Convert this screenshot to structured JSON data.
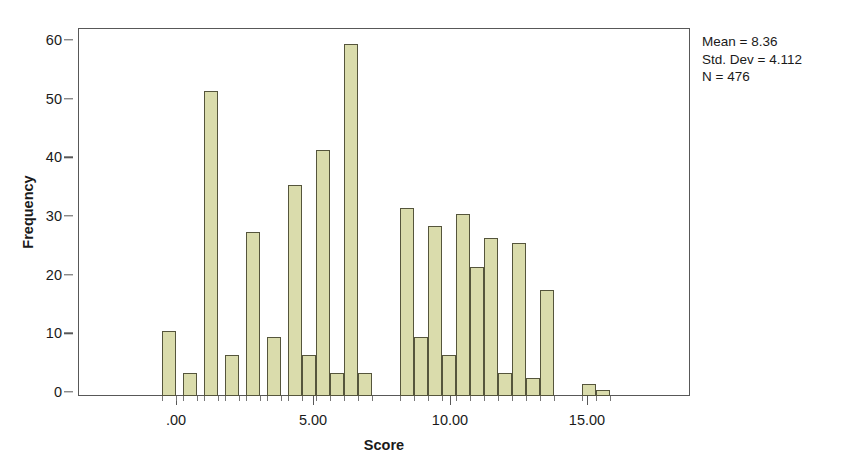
{
  "chart_data": {
    "type": "bar",
    "title": "",
    "subtitle": "",
    "xlabel": "Score",
    "ylabel": "Frequency",
    "xlim": [
      -1.0,
      17.2
    ],
    "ylim": [
      0,
      63
    ],
    "grid": false,
    "legend": null,
    "bar_width_units": 0.42,
    "x_ticks": [
      {
        "value": 0,
        "label": ".00"
      },
      {
        "value": 5,
        "label": "5.00"
      },
      {
        "value": 10,
        "label": "10.00"
      },
      {
        "value": 15,
        "label": "15.00"
      }
    ],
    "y_ticks": [
      {
        "value": 0,
        "label": "0"
      },
      {
        "value": 10,
        "label": "10"
      },
      {
        "value": 20,
        "label": "20"
      },
      {
        "value": 30,
        "label": "30"
      },
      {
        "value": 40,
        "label": "40"
      },
      {
        "value": 50,
        "label": "50"
      },
      {
        "value": 60,
        "label": "60"
      }
    ],
    "x": [
      -0.5,
      0.0,
      1.0,
      1.5,
      2.5,
      3.0,
      4.0,
      4.5,
      5.0,
      5.5,
      6.5,
      7.0,
      8.0,
      8.5,
      9.5,
      10.0,
      10.5,
      11.0,
      11.5,
      12.0,
      12.5,
      13.0,
      13.5,
      14.0,
      15.0,
      15.5,
      16.0
    ],
    "categories": [
      "-0.5",
      "0.0",
      "1.0",
      "1.5",
      "2.5",
      "3.0",
      "4.0",
      "4.5",
      "5.0",
      "5.5",
      "6.5",
      "7.0",
      "8.0",
      "8.5",
      "9.5",
      "10.0",
      "10.5",
      "11.0",
      "11.5",
      "12.0",
      "12.5",
      "13.0",
      "13.5",
      "14.0",
      "15.0",
      "15.5",
      "16.0"
    ],
    "values": [
      11,
      4,
      52,
      7,
      28,
      10,
      36,
      7,
      42,
      4,
      60,
      4,
      32,
      10,
      29,
      7,
      31,
      22,
      27,
      4,
      26,
      3,
      18,
      0,
      2,
      1,
      0
    ],
    "bars": [
      {
        "left_px": 84,
        "width_px": 14,
        "value": 11
      },
      {
        "left_px": 105,
        "width_px": 14,
        "value": 4
      },
      {
        "left_px": 126,
        "width_px": 14,
        "value": 52
      },
      {
        "left_px": 147,
        "width_px": 14,
        "value": 7
      },
      {
        "left_px": 168,
        "width_px": 14,
        "value": 28
      },
      {
        "left_px": 189,
        "width_px": 14,
        "value": 10
      },
      {
        "left_px": 210,
        "width_px": 14,
        "value": 36
      },
      {
        "left_px": 224,
        "width_px": 14,
        "value": 7
      },
      {
        "left_px": 238,
        "width_px": 14,
        "value": 42
      },
      {
        "left_px": 252,
        "width_px": 14,
        "value": 4
      },
      {
        "left_px": 266,
        "width_px": 14,
        "value": 60
      },
      {
        "left_px": 280,
        "width_px": 14,
        "value": 4
      },
      {
        "left_px": 322,
        "width_px": 14,
        "value": 32
      },
      {
        "left_px": 336,
        "width_px": 14,
        "value": 10
      },
      {
        "left_px": 350,
        "width_px": 14,
        "value": 29
      },
      {
        "left_px": 364,
        "width_px": 14,
        "value": 7
      },
      {
        "left_px": 378,
        "width_px": 14,
        "value": 31
      },
      {
        "left_px": 392,
        "width_px": 14,
        "value": 22
      },
      {
        "left_px": 406,
        "width_px": 14,
        "value": 27
      },
      {
        "left_px": 420,
        "width_px": 14,
        "value": 4
      },
      {
        "left_px": 434,
        "width_px": 14,
        "value": 26
      },
      {
        "left_px": 448,
        "width_px": 14,
        "value": 3
      },
      {
        "left_px": 462,
        "width_px": 14,
        "value": 18
      },
      {
        "left_px": 504,
        "width_px": 14,
        "value": 2
      },
      {
        "left_px": 518,
        "width_px": 14,
        "value": 1
      }
    ],
    "bar_fill_color": "#dadcac",
    "bar_border_color": "#55553c",
    "axis_color": "#585858",
    "annotations": {
      "mean": "Mean = 8.36",
      "std_dev": "Std. Dev = 4.112",
      "n": "N = 476"
    }
  }
}
